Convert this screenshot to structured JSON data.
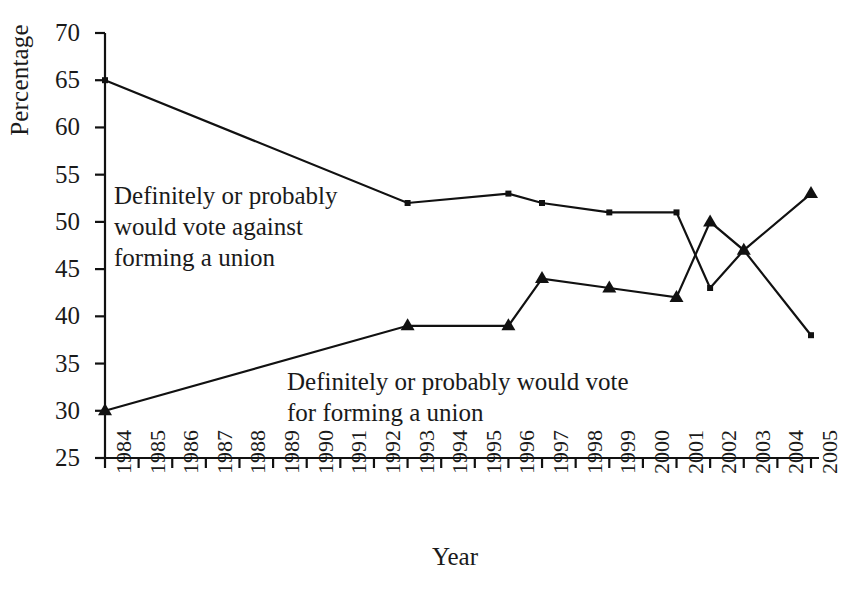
{
  "chart_data": {
    "type": "line",
    "title": "",
    "xlabel": "Year",
    "ylabel": "Percentage",
    "xlim": [
      1984,
      2005
    ],
    "ylim": [
      25,
      70
    ],
    "yticks": [
      25,
      30,
      35,
      40,
      45,
      50,
      55,
      60,
      65,
      70
    ],
    "xticks": [
      1984,
      1985,
      1986,
      1987,
      1988,
      1989,
      1990,
      1991,
      1992,
      1993,
      1994,
      1995,
      1996,
      1997,
      1998,
      1999,
      2000,
      2001,
      2002,
      2003,
      2004,
      2005
    ],
    "grid": false,
    "legend_position": "inline-annotations",
    "series": [
      {
        "name": "Definitely or probably would vote against forming a union",
        "marker": "square",
        "color": "#111111",
        "x": [
          1984,
          1993,
          1996,
          1997,
          1999,
          2001,
          2002,
          2003,
          2005
        ],
        "values": [
          65,
          52,
          53,
          52,
          51,
          51,
          43,
          47,
          38
        ]
      },
      {
        "name": "Definitely or probably would vote for forming a union",
        "marker": "triangle",
        "color": "#111111",
        "x": [
          1984,
          1993,
          1996,
          1997,
          1999,
          2001,
          2002,
          2003,
          2005
        ],
        "values": [
          30,
          39,
          39,
          44,
          43,
          42,
          50,
          47,
          53
        ]
      }
    ],
    "annotations": [
      {
        "id": "against",
        "lines": [
          "Definitely or probably",
          "would vote against",
          "forming a union"
        ]
      },
      {
        "id": "for",
        "lines": [
          "Definitely or probably would vote",
          "for forming a union"
        ]
      }
    ]
  },
  "axis": {
    "y_title": "Percentage",
    "x_title": "Year",
    "y_tick_labels": [
      "70",
      "65",
      "60",
      "55",
      "50",
      "45",
      "40",
      "35",
      "30",
      "25"
    ],
    "x_tick_labels": [
      "1984",
      "1985",
      "1986",
      "1987",
      "1988",
      "1989",
      "1990",
      "1991",
      "1992",
      "1993",
      "1994",
      "1995",
      "1996",
      "1997",
      "1998",
      "1999",
      "2000",
      "2001",
      "2002",
      "2003",
      "2004",
      "2005"
    ]
  },
  "annotations": {
    "against_line1": "Definitely or probably",
    "against_line2": "would vote against",
    "against_line3": "forming a union",
    "for_line1": "Definitely or probably would vote",
    "for_line2": "for forming a union"
  },
  "colors": {
    "ink": "#111111",
    "background": "#ffffff"
  }
}
